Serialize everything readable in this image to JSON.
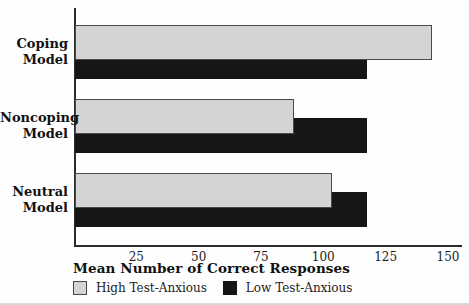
{
  "chart_data": {
    "type": "bar",
    "orientation": "horizontal",
    "title": "",
    "xlabel": "Mean Number of Correct Responses",
    "ylabel": "",
    "categories": [
      "Coping Model",
      "Noncoping Model",
      "Neutral Model"
    ],
    "series": [
      {
        "name": "High Test-Anxious",
        "color": "#d4d4d4",
        "border_color": "#4a4a4a",
        "values": [
          143,
          88,
          103
        ]
      },
      {
        "name": "Low Test-Anxious",
        "color": "#161616",
        "border_color": "#161616",
        "values": [
          117,
          117,
          117
        ]
      }
    ],
    "xticks": [
      25,
      50,
      75,
      100,
      125,
      150
    ],
    "xlim": [
      0,
      150
    ],
    "grid": false,
    "legend_position": "bottom",
    "axis_color": "#2b2b2b",
    "text_color": "#121212"
  }
}
